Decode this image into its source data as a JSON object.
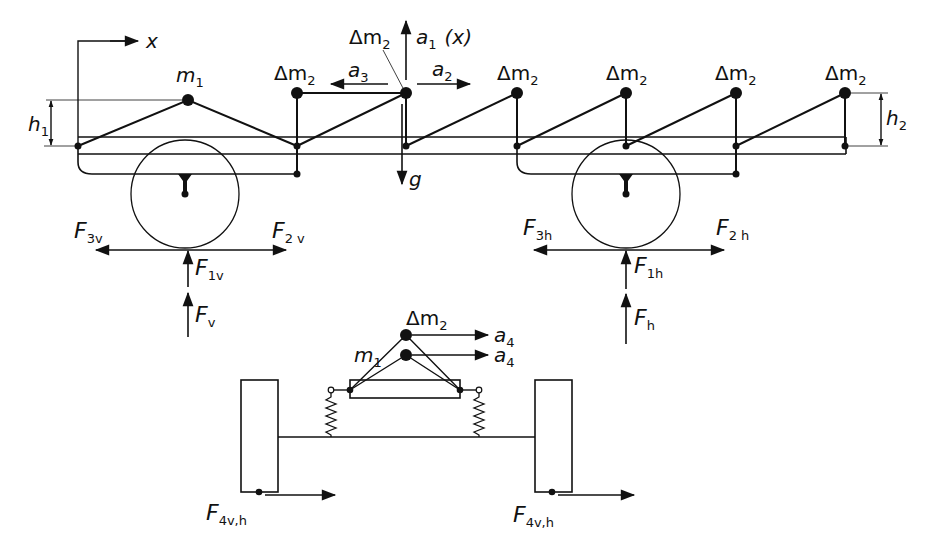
{
  "figure": {
    "type": "free-body diagram of vehicle load distribution",
    "views": [
      "side-view",
      "rear-view"
    ]
  },
  "labels": {
    "x_axis": "x",
    "m1": "m",
    "m1_sub": "1",
    "dm2": "Δm",
    "dm2_sub": "2",
    "a1": "a",
    "a1_sub": "1",
    "a1_suffix": "(x)",
    "a2": "a",
    "a2_sub": "2",
    "a3": "a",
    "a3_sub": "3",
    "a4": "a",
    "a4_sub": "4",
    "g": "g",
    "h1": "h",
    "h1_sub": "1",
    "h2": "h",
    "h2_sub": "2",
    "F": "F",
    "F3v_sub": "3v",
    "F2v_sub": "2 v",
    "F1v_sub": "1v",
    "Fv_sub": "v",
    "F3h_sub": "3h",
    "F2h_sub": "2 h",
    "F1h_sub": "1h",
    "Fh_sub": "h",
    "F4vh_sub": "4v,h"
  },
  "side_view": {
    "masses": [
      "m1",
      "Δm2",
      "Δm2",
      "Δm2",
      "Δm2",
      "Δm2",
      "Δm2"
    ],
    "wheels": [
      "front (v)",
      "rear (h)"
    ],
    "forces_front": [
      "F3v",
      "F2v",
      "F1v",
      "Fv"
    ],
    "forces_rear": [
      "F3h",
      "F2h",
      "F1h",
      "Fh"
    ],
    "accelerations": [
      "a1 (x)",
      "a2",
      "a3",
      "g"
    ],
    "heights": [
      "h1",
      "h2"
    ]
  },
  "rear_view": {
    "masses": [
      "Δm2",
      "m1"
    ],
    "accelerations": [
      "a4",
      "a4"
    ],
    "forces": [
      "F4v,h",
      "F4v,h"
    ]
  }
}
